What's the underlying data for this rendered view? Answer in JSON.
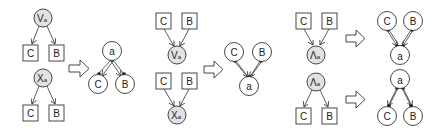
{
  "figure": {
    "panels": [
      {
        "id": "panel-1",
        "left_graphs": [
          {
            "parent": {
              "label": "V",
              "sub": "a",
              "shape": "grey-circle"
            },
            "children": [
              {
                "label": "C",
                "shape": "box"
              },
              {
                "label": "B",
                "shape": "box"
              }
            ],
            "direction": "parent-to-children"
          },
          {
            "parent": {
              "label": "X",
              "sub": "a",
              "shape": "grey-circle"
            },
            "children": [
              {
                "label": "C",
                "shape": "box"
              },
              {
                "label": "B",
                "shape": "box"
              }
            ],
            "direction": "parent-to-children"
          }
        ],
        "arrow": "right",
        "right_graph": {
          "top": {
            "label": "a"
          },
          "bottom": [
            {
              "label": "C"
            },
            {
              "label": "B"
            }
          ],
          "direction": "top-to-bottom",
          "double_edges": true
        }
      },
      {
        "id": "panel-2",
        "left_graphs": [
          {
            "parent": {
              "label": "V",
              "sub": "a",
              "shape": "grey-circle"
            },
            "children": [
              {
                "label": "C",
                "shape": "box"
              },
              {
                "label": "B",
                "shape": "box"
              }
            ],
            "direction": "children-to-parent"
          },
          {
            "parent": {
              "label": "X",
              "sub": "a",
              "shape": "grey-circle"
            },
            "children": [
              {
                "label": "C",
                "shape": "box"
              },
              {
                "label": "B",
                "shape": "box"
              }
            ],
            "direction": "children-to-parent"
          }
        ],
        "arrow": "right",
        "right_graph": {
          "top": [
            {
              "label": "C"
            },
            {
              "label": "B"
            }
          ],
          "bottom": {
            "label": "a"
          },
          "direction": "top-to-bottom",
          "double_edges": true
        }
      },
      {
        "id": "panel-3",
        "rows": [
          {
            "left": {
              "parent": {
                "label": "Λ",
                "sub": "a"
              },
              "children": [
                {
                  "label": "C"
                },
                {
                  "label": "B"
                }
              ],
              "direction": "children-to-parent"
            },
            "arrow": "right",
            "right": {
              "top": [
                {
                  "label": "C"
                },
                {
                  "label": "B"
                }
              ],
              "bottom": {
                "label": "a"
              }
            }
          },
          {
            "left": {
              "parent": {
                "label": "Λ",
                "sub": "a"
              },
              "children": [
                {
                  "label": "C"
                },
                {
                  "label": "B"
                }
              ],
              "direction": "parent-to-children"
            },
            "arrow": "right",
            "right": {
              "top": {
                "label": "a"
              },
              "bottom": [
                {
                  "label": "C"
                },
                {
                  "label": "B"
                }
              ]
            }
          }
        ]
      }
    ],
    "labels": {
      "V": "V",
      "X": "X",
      "L": "Λ",
      "sub": "a",
      "C": "C",
      "B": "B",
      "a": "a"
    }
  }
}
